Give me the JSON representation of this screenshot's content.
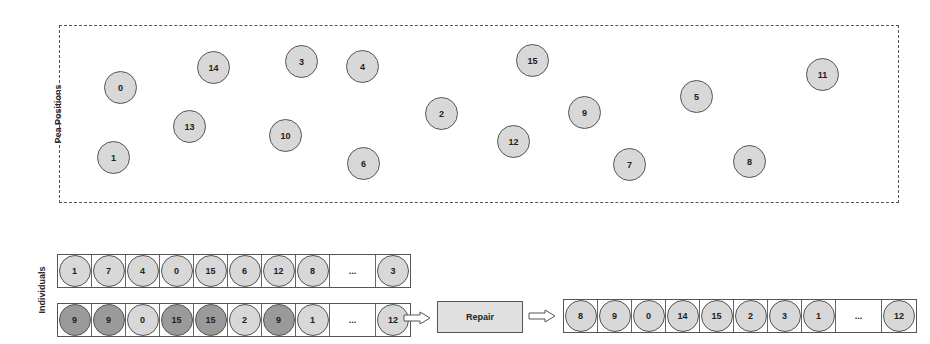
{
  "labels": {
    "pea_positions": "Pea Positions",
    "individuals": "Individuals",
    "repair": "Repair",
    "ellipsis": "..."
  },
  "colors": {
    "pea_fill": "#d8d8d8",
    "duplicate_fill": "#9a9a9a",
    "stroke": "#555555"
  },
  "peas": [
    {
      "id": "0",
      "x": 119,
      "y": 86
    },
    {
      "id": "1",
      "x": 112,
      "y": 156
    },
    {
      "id": "2",
      "x": 440,
      "y": 112
    },
    {
      "id": "3",
      "x": 300,
      "y": 60
    },
    {
      "id": "4",
      "x": 361,
      "y": 65
    },
    {
      "id": "5",
      "x": 695,
      "y": 95
    },
    {
      "id": "6",
      "x": 362,
      "y": 162
    },
    {
      "id": "7",
      "x": 628,
      "y": 163
    },
    {
      "id": "8",
      "x": 748,
      "y": 160
    },
    {
      "id": "9",
      "x": 583,
      "y": 111
    },
    {
      "id": "10",
      "x": 284,
      "y": 134
    },
    {
      "id": "11",
      "x": 821,
      "y": 73
    },
    {
      "id": "12",
      "x": 512,
      "y": 140
    },
    {
      "id": "13",
      "x": 188,
      "y": 125
    },
    {
      "id": "14",
      "x": 212,
      "y": 66
    },
    {
      "id": "15",
      "x": 531,
      "y": 59
    }
  ],
  "individuals": {
    "individual_1": {
      "genes": [
        {
          "v": "1",
          "dup": false
        },
        {
          "v": "7",
          "dup": false
        },
        {
          "v": "4",
          "dup": false
        },
        {
          "v": "0",
          "dup": false
        },
        {
          "v": "15",
          "dup": false
        },
        {
          "v": "6",
          "dup": false
        },
        {
          "v": "12",
          "dup": false
        },
        {
          "v": "8",
          "dup": false
        }
      ],
      "last": {
        "v": "3",
        "dup": false
      }
    },
    "individual_2": {
      "genes": [
        {
          "v": "9",
          "dup": true
        },
        {
          "v": "9",
          "dup": true
        },
        {
          "v": "0",
          "dup": false
        },
        {
          "v": "15",
          "dup": true
        },
        {
          "v": "15",
          "dup": true
        },
        {
          "v": "2",
          "dup": false
        },
        {
          "v": "9",
          "dup": true
        },
        {
          "v": "1",
          "dup": false
        }
      ],
      "last": {
        "v": "12",
        "dup": false
      }
    },
    "repaired": {
      "genes": [
        {
          "v": "8",
          "dup": false
        },
        {
          "v": "9",
          "dup": false
        },
        {
          "v": "0",
          "dup": false
        },
        {
          "v": "14",
          "dup": false
        },
        {
          "v": "15",
          "dup": false
        },
        {
          "v": "2",
          "dup": false
        },
        {
          "v": "3",
          "dup": false
        },
        {
          "v": "1",
          "dup": false
        }
      ],
      "last": {
        "v": "12",
        "dup": false
      }
    }
  }
}
